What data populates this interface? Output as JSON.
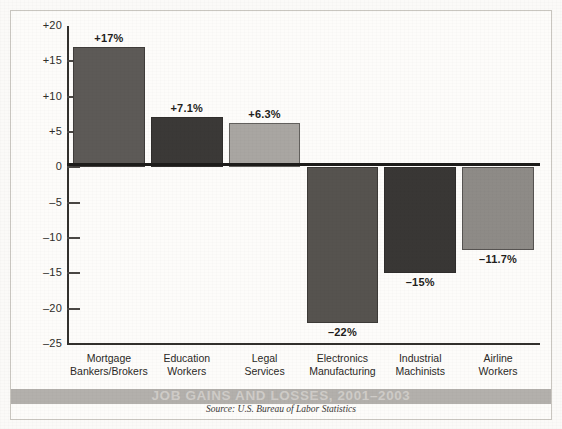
{
  "chart_data": {
    "type": "bar",
    "title": "JOB GAINS AND LOSSES, 2001–2003",
    "source": "Source: U.S. Bureau of Labor Statistics",
    "xlabel": "",
    "ylabel": "",
    "ylim": [
      -25,
      20
    ],
    "grid": false,
    "legend": "none",
    "yticks": [
      {
        "value": 20,
        "label": "+20"
      },
      {
        "value": 15,
        "label": "+15"
      },
      {
        "value": 10,
        "label": "+10"
      },
      {
        "value": 5,
        "label": "+5"
      },
      {
        "value": 0,
        "label": "0"
      },
      {
        "value": -5,
        "label": "–5"
      },
      {
        "value": -10,
        "label": "–10"
      },
      {
        "value": -15,
        "label": "–15"
      },
      {
        "value": -20,
        "label": "–20"
      },
      {
        "value": -25,
        "label": "–25"
      }
    ],
    "categories": [
      "Mortgage Bankers/Brokers",
      "Education Workers",
      "Legal Services",
      "Electronics Manufacturing",
      "Industrial Machinists",
      "Airline Workers"
    ],
    "values": [
      17,
      7.1,
      6.3,
      -22,
      -15,
      -11.7
    ],
    "data_labels": [
      "+17%",
      "+7.1%",
      "+6.3%",
      "–22%",
      "–15%",
      "–11.7%"
    ],
    "bar_colors": [
      "#5d5a57",
      "#3b3937",
      "#a9a6a2",
      "#56534f",
      "#393735",
      "#8e8b87"
    ],
    "bars": [
      {
        "label_line1": "Mortgage",
        "label_line2": "Bankers/Brokers",
        "value": 17,
        "data_label": "+17%",
        "color": "#5d5a57"
      },
      {
        "label_line1": "Education",
        "label_line2": "Workers",
        "value": 7.1,
        "data_label": "+7.1%",
        "color": "#3b3937"
      },
      {
        "label_line1": "Legal",
        "label_line2": "Services",
        "value": 6.3,
        "data_label": "+6.3%",
        "color": "#a9a6a2"
      },
      {
        "label_line1": "Electronics",
        "label_line2": "Manufacturing",
        "value": -22,
        "data_label": "–22%",
        "color": "#56534f"
      },
      {
        "label_line1": "Industrial",
        "label_line2": "Machinists",
        "value": -15,
        "data_label": "–15%",
        "color": "#393735"
      },
      {
        "label_line1": "Airline",
        "label_line2": "Workers",
        "value": -11.7,
        "data_label": "–11.7%",
        "color": "#8e8b87"
      }
    ]
  },
  "colors": {
    "title_band": "#b3b0ac",
    "title_text": "#cfccc8",
    "axis": "#33312e",
    "paper": "#fdfcfa"
  }
}
